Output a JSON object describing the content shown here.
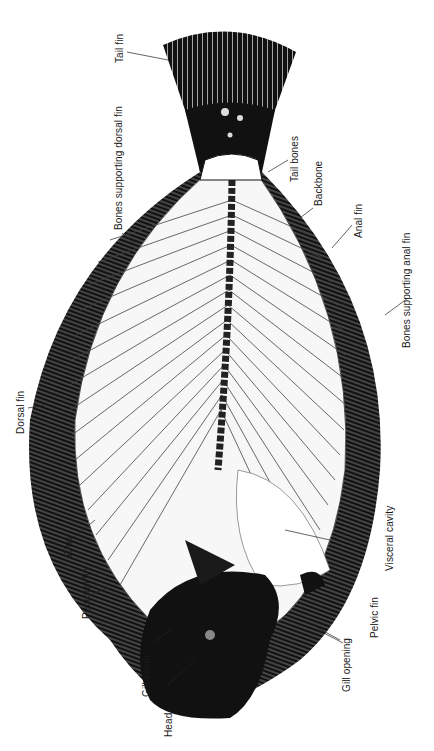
{
  "diagram": {
    "orientation": "rotated 90° counter-clockwise; head at bottom, tail at top",
    "colors": {
      "ink": "#111111",
      "paper": "#ffffff",
      "bone": "#f4f4f4"
    },
    "labels": [
      {
        "id": "tail-fin",
        "text": "Tail fin"
      },
      {
        "id": "bones-supporting-dorsal-fin",
        "text": "Bones supporting dorsal fin"
      },
      {
        "id": "tail-bones",
        "text": "Tail bones"
      },
      {
        "id": "backbone",
        "text": "Backbone"
      },
      {
        "id": "anal-fin",
        "text": "Anal fin"
      },
      {
        "id": "bones-supporting-anal-fin",
        "text": "Bones supporting anal fin"
      },
      {
        "id": "dorsal-fin",
        "text": "Dorsal fin"
      },
      {
        "id": "ribs",
        "text": "Ribs"
      },
      {
        "id": "pectoral-fin",
        "text": "Pectoral fin"
      },
      {
        "id": "visceral-cavity",
        "text": "Visceral cavity"
      },
      {
        "id": "gill-cover",
        "text": "Gill cover"
      },
      {
        "id": "head",
        "text": "Head"
      },
      {
        "id": "gill-opening",
        "text": "Gill opening"
      },
      {
        "id": "pelvic-fin",
        "text": "Pelvic fin"
      }
    ]
  }
}
